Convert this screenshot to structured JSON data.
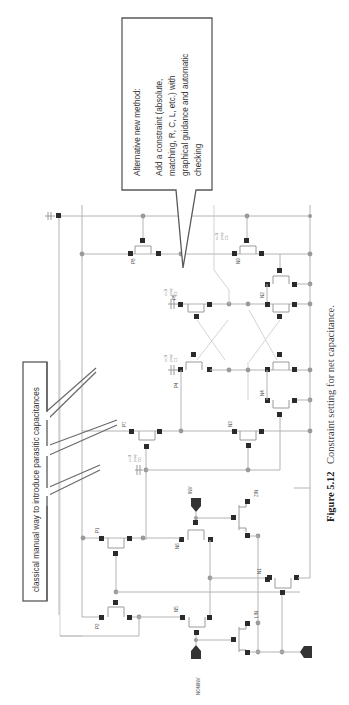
{
  "figure": {
    "number_label": "Figure 5.12",
    "caption": "Constraint setting for net capacitance.",
    "orientation": "rotated 90° counter-clockwise"
  },
  "callouts": {
    "new_method": {
      "title": "Alternative new method:",
      "lines": [
        "Add a constraint (absolute,",
        "matching, R, C, L, etc.) with",
        "graphical guidance and automatic",
        "checking"
      ]
    },
    "classical": {
      "text": "classical manual way to introduce parasitic capacitances"
    }
  },
  "schematic": {
    "devices": {
      "p1": "P1",
      "p2": "P2",
      "p4": "P4",
      "p5": "P5",
      "p7": "P7",
      "p8": "P8",
      "n1": "N1",
      "n3": "N3",
      "n5": "N5",
      "n6": "N6",
      "n8": "N8",
      "n9": "N9",
      "n2": "N2",
      "n4": "N4",
      "lin": "LIN",
      "zin": "ZIN"
    },
    "capacitors": {
      "c_p7": {
        "name": "C0",
        "type": "pcap",
        "value": "c=1f"
      },
      "c_p4": {
        "name": "C1",
        "type": "pcap",
        "value": "c=1f"
      },
      "c_p5": {
        "name": "C2",
        "type": "pcap",
        "value": "c=1f"
      },
      "c_right": {
        "name": "C3",
        "type": "pcap",
        "value": "c=1f"
      }
    },
    "pins": {
      "inv": "INV",
      "noninv": "NONINV"
    }
  }
}
